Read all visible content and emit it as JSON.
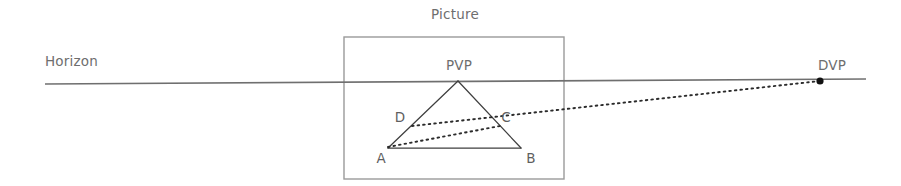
{
  "canvas": {
    "width": 901,
    "height": 186,
    "background": "#ffffff"
  },
  "colors": {
    "horizon_line": "#6f6f6f",
    "frame_line": "#9a9a9a",
    "shape_stroke": "#3f3f3f",
    "dotted_line": "#2b2b2b",
    "label_text": "#6e6e6e",
    "vertex_text": "#5f5f5f",
    "vanishing_point_dot": "#111111"
  },
  "labels": {
    "horizon": "Horizon",
    "picture": "Picture",
    "pvp": "PVP",
    "dvp": "DVP",
    "vertex_a": "A",
    "vertex_b": "B",
    "vertex_c": "C",
    "vertex_d": "D"
  },
  "label_positions": {
    "horizon": {
      "x": 45,
      "y": 66,
      "anchor": "start"
    },
    "picture": {
      "x": 455,
      "y": 19,
      "anchor": "middle"
    },
    "pvp": {
      "x": 459,
      "y": 70,
      "anchor": "middle"
    },
    "dvp": {
      "x": 832,
      "y": 70,
      "anchor": "middle"
    },
    "vertex_a": {
      "x": 381,
      "y": 163,
      "anchor": "middle"
    },
    "vertex_b": {
      "x": 531,
      "y": 163,
      "anchor": "middle"
    },
    "vertex_c": {
      "x": 506,
      "y": 122,
      "anchor": "middle"
    },
    "vertex_d": {
      "x": 400,
      "y": 122,
      "anchor": "middle"
    }
  },
  "geometry": {
    "horizon_line": {
      "x1": 45,
      "y1": 84,
      "x2": 866,
      "y2": 79,
      "stroke_width": 1.6
    },
    "picture_frame": {
      "x": 344,
      "y": 37,
      "width": 220,
      "height": 142,
      "stroke_width": 1.4
    },
    "points": {
      "PVP": {
        "x": 458,
        "y": 81
      },
      "A": {
        "x": 388,
        "y": 148
      },
      "B": {
        "x": 521,
        "y": 148
      },
      "C": {
        "x": 500,
        "y": 125
      },
      "D": {
        "x": 412,
        "y": 126
      },
      "DVP": {
        "x": 820,
        "y": 81
      }
    },
    "solid_edges": [
      {
        "name": "pvp-to-a",
        "x1": 458,
        "y1": 81,
        "x2": 388,
        "y2": 148
      },
      {
        "name": "pvp-to-b",
        "x1": 458,
        "y1": 81,
        "x2": 521,
        "y2": 148
      },
      {
        "name": "a-to-b",
        "x1": 388,
        "y1": 148,
        "x2": 521,
        "y2": 148
      }
    ],
    "dotted_edges": [
      {
        "name": "d-to-dvp",
        "x1": 412,
        "y1": 126,
        "x2": 820,
        "y2": 81,
        "dash": "1.6 4.0"
      },
      {
        "name": "a-to-c",
        "x1": 388,
        "y1": 147,
        "x2": 500,
        "y2": 126,
        "dash": "1.6 4.0"
      }
    ],
    "vanishing_dot": {
      "cx": 820,
      "cy": 81,
      "r": 3.6
    },
    "stroke_width_shape": 1.25,
    "stroke_width_dotted": 1.9
  },
  "diagram_meta": {
    "type": "perspective-construction-diagram",
    "description": "Horizon line with picture plane frame, triangle A-B-PVP, and dotted convergence lines to the distance vanishing point DVP"
  }
}
